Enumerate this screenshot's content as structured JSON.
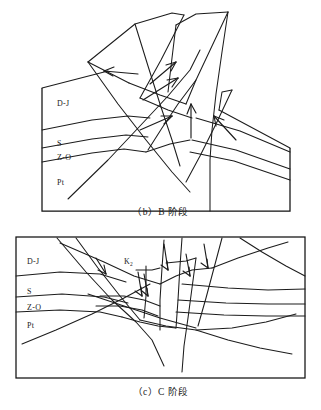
{
  "figure": {
    "type": "geological-cross-section-diagram",
    "background_color": "#ffffff",
    "line_color": "#1c1c1c"
  },
  "panels": [
    {
      "id": "b",
      "caption": "（b）B 阶段",
      "caption_latin": "(b) B",
      "caption_cjk": "阶段",
      "stratigraphic_labels": [
        {
          "text": "D-J",
          "x": 57,
          "y": 103
        },
        {
          "text": "S",
          "x": 57,
          "y": 143
        },
        {
          "text": "Z-O",
          "x": 57,
          "y": 157
        },
        {
          "text": "Pt",
          "x": 57,
          "y": 182
        }
      ],
      "frame": {
        "left": 42,
        "top": 88,
        "right": 290,
        "bottom": 211
      },
      "thrust_arrow_count": 6,
      "description": "Stage B: imbricate thrust sheets ramp upward and are eroded above the datum; hanging-wall anticline with multiple thrust faults cutting D-J, S, Z-O and Pt units."
    },
    {
      "id": "c",
      "caption": "（c）C 阶段",
      "caption_latin": "(c) C",
      "caption_cjk": "阶段",
      "stratigraphic_labels": [
        {
          "text": "D-J",
          "x": 33,
          "y": 261
        },
        {
          "text": "S",
          "x": 33,
          "y": 291
        },
        {
          "text": "Z-O",
          "x": 33,
          "y": 307
        },
        {
          "text": "Pt",
          "x": 33,
          "y": 325
        }
      ],
      "unit_labels": [
        {
          "text": "K",
          "subscript": "2",
          "x": 126,
          "y": 262
        }
      ],
      "frame": {
        "left": 16,
        "top": 237,
        "right": 305,
        "bottom": 378
      },
      "normal_fault_arrow_count": 5,
      "description": "Stage C: extensional collapse, normal faults with downward slip arrows offset the earlier thrust stack; K2 basin fill deposited over the eroded thrust sheets."
    }
  ],
  "legend_units": [
    {
      "code": "D-J",
      "meaning": "Devonian to Jurassic"
    },
    {
      "code": "S",
      "meaning": "Silurian"
    },
    {
      "code": "Z-O",
      "meaning": "Sinian to Ordovician"
    },
    {
      "code": "Pt",
      "meaning": "Proterozoic"
    },
    {
      "code": "K2",
      "meaning": "Upper Cretaceous"
    }
  ]
}
